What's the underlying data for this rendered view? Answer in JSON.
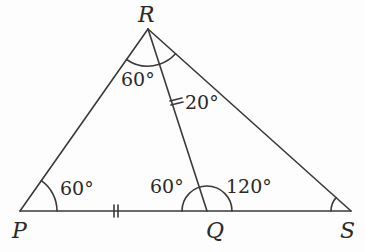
{
  "diagram": {
    "type": "geometry-triangle",
    "line_color": "#3a3a3a",
    "text_color": "#2a2a2a",
    "vertices": {
      "P": {
        "label": "P",
        "x": 20,
        "y": 211
      },
      "Q": {
        "label": "Q",
        "x": 207,
        "y": 211
      },
      "S": {
        "label": "S",
        "x": 351,
        "y": 211
      },
      "R": {
        "label": "R",
        "x": 148,
        "y": 29
      }
    },
    "segments": [
      {
        "from": "P",
        "to": "R"
      },
      {
        "from": "R",
        "to": "S"
      },
      {
        "from": "P",
        "to": "S"
      },
      {
        "from": "R",
        "to": "Q"
      }
    ],
    "equal_marks": {
      "PQ": "double-tick",
      "RQ": "double-tick"
    },
    "angles": {
      "at_P": "60°",
      "PRQ": "60°",
      "QRS": "20°",
      "PQR": "60°",
      "RQS": "120°",
      "at_S": ""
    }
  }
}
